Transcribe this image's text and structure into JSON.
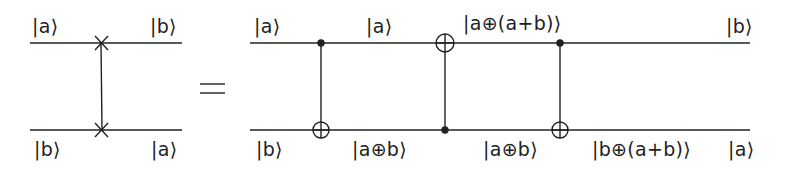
{
  "colors": {
    "ink": "#222222",
    "background": "#ffffff"
  },
  "left_circuit": {
    "name": "swap-gate",
    "labels": {
      "top_in": "|a⟩",
      "top_out": "|b⟩",
      "bottom_in": "|b⟩",
      "bottom_out": "|a⟩"
    },
    "wire_y": [
      43,
      130
    ],
    "wire_x": [
      30,
      182
    ],
    "swap_x": 101
  },
  "equals_sign": "=",
  "right_circuit": {
    "name": "three-cnot-decomposition",
    "wire_y": [
      43,
      130
    ],
    "wire_x": [
      250,
      750
    ],
    "gates": [
      {
        "x": 321,
        "control": "top",
        "target": "bottom"
      },
      {
        "x": 445,
        "control": "bottom",
        "target": "top"
      },
      {
        "x": 560,
        "control": "top",
        "target": "bottom"
      }
    ],
    "top_labels": [
      "|a⟩",
      "|a⟩",
      "|a⊕(a+b)⟩",
      "|b⟩"
    ],
    "bottom_labels": [
      "|b⟩",
      "|a⊕b⟩",
      "|a⊕b⟩",
      "|b⊕(a+b)⟩",
      "|a⟩"
    ]
  }
}
